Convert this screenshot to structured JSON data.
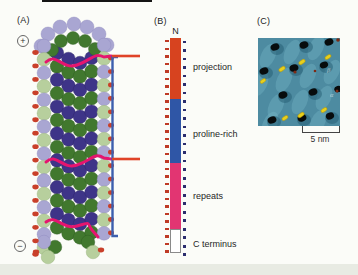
{
  "colors": {
    "bg": "#fbfcf8",
    "band": "#e8ebe3",
    "ink": "#1c1c1c",
    "lavender": "#a9a6d2",
    "lightgreen": "#b7cf9d",
    "darkgreen": "#41782e",
    "navy": "#3e3488",
    "reddot": "#c9402a",
    "redline": "#e04328",
    "magenta": "#e5156f",
    "blueline": "#3c5fae",
    "seg_projection": "#d7431f",
    "seg_proline": "#2f56a6",
    "seg_repeats": "#e23572",
    "seg_cterm": "#ffffff",
    "tick_red": "#bf3a26",
    "tick_navy": "#2b2d6e",
    "teal": "#4d8ba1",
    "teal_light": "#7cbccb",
    "teal_dark": "#245c72",
    "blob_black": "#070b0c",
    "blob_yellow": "#e7d01d",
    "spot_brown": "#7c2a15"
  },
  "panels": {
    "a": {
      "label": "(A)",
      "plus_symbol": "+",
      "minus_symbol": "−"
    },
    "b": {
      "label": "(B)",
      "n_terminus": "N",
      "segments": [
        {
          "label": "projection"
        },
        {
          "label": "proline-rich"
        },
        {
          "label": "repeats"
        },
        {
          "label": "C terminus"
        }
      ]
    },
    "c": {
      "label": "(C)",
      "scale_bar_label": "5 nm",
      "annotation_beta": "β",
      "annotation_alpha": "α"
    }
  }
}
